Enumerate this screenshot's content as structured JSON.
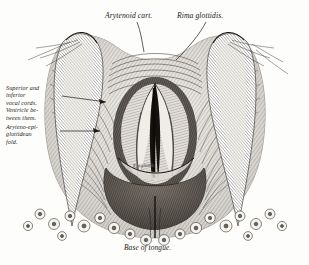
{
  "figure": {
    "kind": "anatomical-engraving",
    "background_color": "#fdfdfc",
    "ink_color": "#1c1a17"
  },
  "labels": {
    "arytenoid_cartilage": "Arytenoid cart.",
    "rima_glottidis": "Rima glottidis.",
    "vocal_cords": "Superior and\ninferior\nvocal cords.\nVentricle be-\ntween them.",
    "aryteno_epiglottidean_fold": "Aryteno-epi-\nglottidean\nfold.",
    "epiglottis": "Epiglottis.",
    "base_of_tongue": "Base of tongue."
  }
}
